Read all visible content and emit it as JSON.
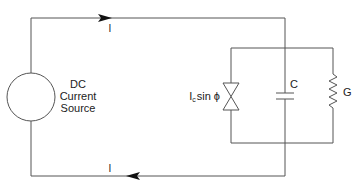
{
  "diagram": {
    "type": "circuit",
    "title": "",
    "source": {
      "lines": [
        "DC",
        "Current",
        "Source"
      ]
    },
    "current_top": {
      "label": "I",
      "direction": "right"
    },
    "current_bottom": {
      "label": "I",
      "direction": "left"
    },
    "components": {
      "junction": {
        "label_main": "I",
        "label_sub": "c",
        "label_rest": "sin ϕ"
      },
      "capacitor": {
        "label": "C"
      },
      "conductance": {
        "label": "G"
      }
    },
    "colors": {
      "wire": "#555555",
      "arrow": "#111111",
      "text": "#222222"
    }
  }
}
